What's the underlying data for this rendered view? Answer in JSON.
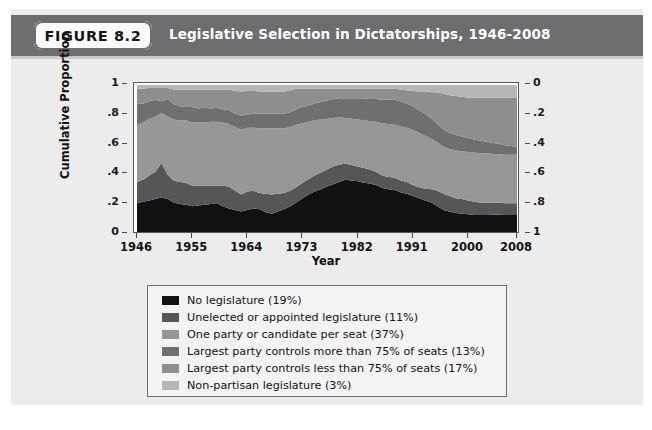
{
  "header": {
    "badge_label": "FIGURE 8.2",
    "title": "Legislative Selection in Dictatorships, 1946-2008",
    "bar_color": "#6d6d6f",
    "badge_bg": "#fbfbfb"
  },
  "chart_data": {
    "type": "area",
    "title": "Legislative Selection in Dictatorships, 1946-2008",
    "xlabel": "Year",
    "ylabel": "Cumulative Proportion",
    "ylabel_right": "",
    "xlim": [
      1946,
      2008
    ],
    "ylim": [
      0,
      1
    ],
    "grid": false,
    "legend_position": "below",
    "stacked": true,
    "x_ticks": [
      "1946",
      "1955",
      "1964",
      "1973",
      "1982",
      "1991",
      "2000",
      "2008"
    ],
    "x_tick_values": [
      1946,
      1955,
      1964,
      1973,
      1982,
      1991,
      2000,
      2008
    ],
    "y_ticks_left": [
      "1",
      ".8",
      ".6",
      ".4",
      ".2",
      "0"
    ],
    "y_tick_values_left": [
      1,
      0.8,
      0.6,
      0.4,
      0.2,
      0
    ],
    "y_ticks_right": [
      "0",
      ".2",
      ".4",
      ".6",
      ".8",
      "1"
    ],
    "y_tick_values_right": [
      0,
      0.2,
      0.4,
      0.6,
      0.8,
      1
    ],
    "x": [
      1946,
      1947,
      1948,
      1949,
      1950,
      1951,
      1952,
      1953,
      1954,
      1955,
      1956,
      1957,
      1958,
      1959,
      1960,
      1961,
      1962,
      1963,
      1964,
      1965,
      1966,
      1967,
      1968,
      1969,
      1970,
      1971,
      1972,
      1973,
      1974,
      1975,
      1976,
      1977,
      1978,
      1979,
      1980,
      1981,
      1982,
      1983,
      1984,
      1985,
      1986,
      1987,
      1988,
      1989,
      1990,
      1991,
      1992,
      1993,
      1994,
      1995,
      1996,
      1997,
      1998,
      1999,
      2000,
      2001,
      2002,
      2003,
      2004,
      2005,
      2006,
      2007,
      2008
    ],
    "series": [
      {
        "name": "No legislature (19%)",
        "share": 19,
        "color": "#111111",
        "values": [
          0.195,
          0.205,
          0.215,
          0.225,
          0.235,
          0.225,
          0.2,
          0.19,
          0.185,
          0.175,
          0.18,
          0.185,
          0.19,
          0.195,
          0.175,
          0.16,
          0.15,
          0.14,
          0.15,
          0.16,
          0.155,
          0.135,
          0.125,
          0.14,
          0.155,
          0.175,
          0.2,
          0.23,
          0.255,
          0.275,
          0.29,
          0.31,
          0.325,
          0.34,
          0.355,
          0.35,
          0.345,
          0.335,
          0.33,
          0.32,
          0.3,
          0.29,
          0.285,
          0.27,
          0.26,
          0.245,
          0.23,
          0.215,
          0.2,
          0.175,
          0.15,
          0.14,
          0.13,
          0.125,
          0.12,
          0.115,
          0.115,
          0.115,
          0.118,
          0.118,
          0.115,
          0.115,
          0.115
        ]
      },
      {
        "name": "Unelected or appointed legislature (11%)",
        "share": 11,
        "color": "#565658",
        "values": [
          0.145,
          0.15,
          0.17,
          0.185,
          0.235,
          0.165,
          0.15,
          0.15,
          0.15,
          0.14,
          0.135,
          0.13,
          0.125,
          0.12,
          0.14,
          0.15,
          0.13,
          0.115,
          0.125,
          0.12,
          0.11,
          0.125,
          0.13,
          0.12,
          0.11,
          0.105,
          0.105,
          0.105,
          0.105,
          0.11,
          0.115,
          0.115,
          0.12,
          0.12,
          0.11,
          0.105,
          0.1,
          0.1,
          0.095,
          0.09,
          0.085,
          0.085,
          0.085,
          0.08,
          0.08,
          0.075,
          0.075,
          0.08,
          0.09,
          0.105,
          0.11,
          0.105,
          0.1,
          0.1,
          0.095,
          0.09,
          0.085,
          0.085,
          0.082,
          0.082,
          0.08,
          0.08,
          0.08
        ]
      },
      {
        "name": "One party or candidate per seat (37%)",
        "share": 37,
        "color": "#979799",
        "values": [
          0.39,
          0.39,
          0.385,
          0.375,
          0.34,
          0.395,
          0.415,
          0.42,
          0.425,
          0.43,
          0.43,
          0.43,
          0.435,
          0.435,
          0.43,
          0.425,
          0.435,
          0.44,
          0.435,
          0.43,
          0.44,
          0.445,
          0.45,
          0.445,
          0.44,
          0.435,
          0.425,
          0.405,
          0.39,
          0.375,
          0.36,
          0.345,
          0.33,
          0.32,
          0.31,
          0.315,
          0.32,
          0.325,
          0.33,
          0.34,
          0.355,
          0.36,
          0.36,
          0.37,
          0.37,
          0.375,
          0.37,
          0.36,
          0.345,
          0.33,
          0.32,
          0.32,
          0.325,
          0.325,
          0.33,
          0.335,
          0.335,
          0.335,
          0.33,
          0.33,
          0.33,
          0.33,
          0.33
        ]
      },
      {
        "name": "Largest party controls more than 75% of seats (13%)",
        "share": 13,
        "color": "#6f6f71",
        "values": [
          0.14,
          0.13,
          0.12,
          0.115,
          0.08,
          0.12,
          0.105,
          0.095,
          0.09,
          0.105,
          0.095,
          0.1,
          0.09,
          0.095,
          0.09,
          0.095,
          0.09,
          0.095,
          0.09,
          0.095,
          0.1,
          0.1,
          0.1,
          0.1,
          0.1,
          0.1,
          0.105,
          0.11,
          0.11,
          0.115,
          0.12,
          0.125,
          0.13,
          0.13,
          0.135,
          0.14,
          0.145,
          0.15,
          0.15,
          0.155,
          0.16,
          0.165,
          0.17,
          0.17,
          0.165,
          0.16,
          0.155,
          0.15,
          0.14,
          0.125,
          0.115,
          0.11,
          0.105,
          0.1,
          0.095,
          0.09,
          0.085,
          0.08,
          0.075,
          0.07,
          0.065,
          0.06,
          0.055
        ]
      },
      {
        "name": "Largest party controls less than 75% of seats (17%)",
        "share": 17,
        "color": "#8e8e90",
        "values": [
          0.105,
          0.1,
          0.09,
          0.08,
          0.09,
          0.075,
          0.1,
          0.115,
          0.12,
          0.12,
          0.13,
          0.125,
          0.13,
          0.125,
          0.135,
          0.14,
          0.155,
          0.165,
          0.16,
          0.155,
          0.15,
          0.15,
          0.15,
          0.15,
          0.15,
          0.15,
          0.14,
          0.125,
          0.115,
          0.1,
          0.09,
          0.08,
          0.07,
          0.065,
          0.065,
          0.065,
          0.065,
          0.065,
          0.07,
          0.07,
          0.075,
          0.075,
          0.075,
          0.08,
          0.09,
          0.105,
          0.125,
          0.15,
          0.175,
          0.215,
          0.245,
          0.255,
          0.265,
          0.27,
          0.275,
          0.285,
          0.295,
          0.3,
          0.31,
          0.315,
          0.325,
          0.33,
          0.335
        ]
      },
      {
        "name": "Non-partisan legislature (3%)",
        "share": 3,
        "color": "#b6b6b8",
        "values": [
          0.025,
          0.025,
          0.02,
          0.02,
          0.02,
          0.02,
          0.03,
          0.03,
          0.03,
          0.03,
          0.03,
          0.03,
          0.03,
          0.03,
          0.03,
          0.03,
          0.04,
          0.045,
          0.04,
          0.04,
          0.045,
          0.045,
          0.045,
          0.045,
          0.045,
          0.035,
          0.025,
          0.025,
          0.025,
          0.025,
          0.025,
          0.025,
          0.025,
          0.025,
          0.025,
          0.025,
          0.025,
          0.025,
          0.025,
          0.025,
          0.025,
          0.025,
          0.025,
          0.03,
          0.035,
          0.04,
          0.045,
          0.045,
          0.05,
          0.05,
          0.06,
          0.07,
          0.075,
          0.08,
          0.085,
          0.085,
          0.085,
          0.085,
          0.085,
          0.085,
          0.085,
          0.085,
          0.085
        ]
      }
    ],
    "legend": [
      "No legislature (19%)",
      "Unelected or appointed legislature (11%)",
      "One party or candidate per seat (37%)",
      "Largest party controls more than 75% of seats (13%)",
      "Largest party controls less than 75% of seats (17%)",
      "Non-partisan legislature (3%)"
    ]
  }
}
